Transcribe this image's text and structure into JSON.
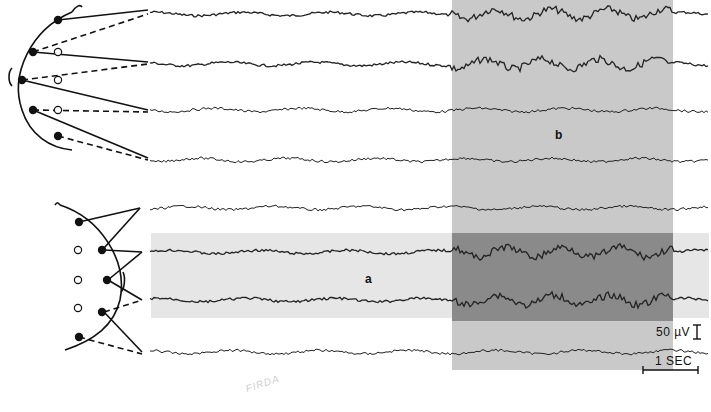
{
  "figure": {
    "type": "EEG recording with electrode montage diagrams",
    "region_labels": {
      "a": "a",
      "b": "b"
    },
    "scale": {
      "amplitude": "50 µV",
      "time": "1 SEC"
    },
    "watermark": "FIRDA",
    "montages": [
      {
        "name": "top montage",
        "channels": 4,
        "closed_electrodes": 5,
        "open_electrodes": 3,
        "style": "bipolar chain, solid and dashed leads"
      },
      {
        "name": "bottom montage",
        "channels": 4,
        "closed_electrodes": 5,
        "open_electrodes": 4,
        "style": "bipolar chain, solid and dashed leads"
      }
    ],
    "channels": [
      {
        "index": 1,
        "group": "top",
        "y": 14
      },
      {
        "index": 2,
        "group": "top",
        "y": 64
      },
      {
        "index": 3,
        "group": "top",
        "y": 110
      },
      {
        "index": 4,
        "group": "top",
        "y": 160
      },
      {
        "index": 5,
        "group": "bottom",
        "y": 208
      },
      {
        "index": 6,
        "group": "bottom",
        "y": 252
      },
      {
        "index": 7,
        "group": "bottom",
        "y": 300
      },
      {
        "index": 8,
        "group": "bottom",
        "y": 352
      }
    ],
    "colors": {
      "background": "#ffffff",
      "band_a": "#e6e6e6",
      "band_b": "#c9c9c9",
      "overlap_ab": "#8a8a8a",
      "trace": "#222222"
    }
  }
}
